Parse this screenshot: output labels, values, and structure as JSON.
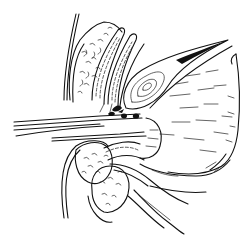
{
  "figure": {
    "kind": "anatomical line illustration",
    "style": "black ink line drawing on white",
    "colors": {
      "ink": "#111111",
      "background": "#ffffff"
    },
    "regions": [
      {
        "id": "upper-left-lobed-mass",
        "description": "textured rounded organ upper left"
      },
      {
        "id": "elongated-striped-structures",
        "description": "two elongated hatched tubular structures"
      },
      {
        "id": "oval-layered-structure",
        "description": "oval concentric-lined structure pointing upper right"
      },
      {
        "id": "large-right-organ",
        "description": "large curved organ with stroke shading on right"
      },
      {
        "id": "horizontal-instruments",
        "description": "parallel horizontal lines entering from left"
      },
      {
        "id": "dark-nodules",
        "description": "small black nodules near center"
      },
      {
        "id": "lower-textured-masses",
        "description": "two textured rounded masses lower left"
      },
      {
        "id": "lower-tubular-branches",
        "description": "curved tubular branches lower center"
      }
    ]
  }
}
